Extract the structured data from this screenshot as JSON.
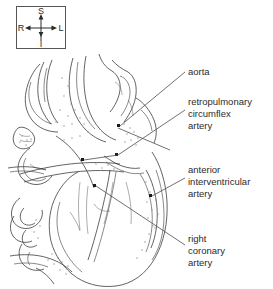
{
  "figure": {
    "type": "anatomical-line-drawing",
    "background_color": "#ffffff",
    "line_color": "#3c3c3c",
    "text_color": "#2b2b2b"
  },
  "compass": {
    "name": "orientation-key",
    "superior": "S",
    "inferior": "I",
    "right": "R",
    "left": "L",
    "border_color": "#555555"
  },
  "labels": [
    {
      "id": "aorta",
      "lines": [
        "aorta"
      ],
      "text": "aorta"
    },
    {
      "id": "retropulmonary-circumflex-artery",
      "lines": [
        "retropulmonary",
        "circumflex",
        "artery"
      ],
      "text": "retropulmonary circumflex artery"
    },
    {
      "id": "anterior-interventricular-artery",
      "lines": [
        "anterior",
        "interventricular",
        "artery"
      ],
      "text": "anterior interventricular artery"
    },
    {
      "id": "right-coronary-artery",
      "lines": [
        "right",
        "coronary",
        "artery"
      ],
      "text": "right coronary artery"
    }
  ]
}
